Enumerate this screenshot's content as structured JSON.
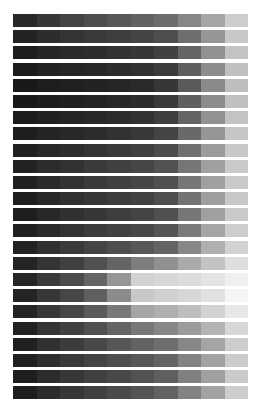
{
  "chart_data": {
    "type": "heatmap",
    "title": "",
    "xlabel": "",
    "ylabel": "",
    "rows": 24,
    "columns": 10,
    "value_scale": "grayscale 0-255 (0=black, 255=white)",
    "values": [
      [
        40,
        55,
        68,
        78,
        88,
        98,
        108,
        135,
        165,
        205
      ],
      [
        35,
        45,
        52,
        58,
        62,
        68,
        78,
        110,
        150,
        200
      ],
      [
        30,
        38,
        42,
        45,
        50,
        55,
        65,
        100,
        145,
        195
      ],
      [
        28,
        35,
        38,
        40,
        45,
        50,
        60,
        95,
        140,
        192
      ],
      [
        25,
        30,
        32,
        35,
        38,
        42,
        55,
        90,
        138,
        190
      ],
      [
        25,
        30,
        33,
        36,
        40,
        45,
        58,
        95,
        140,
        192
      ],
      [
        28,
        33,
        36,
        40,
        44,
        50,
        62,
        100,
        145,
        195
      ],
      [
        30,
        36,
        40,
        44,
        50,
        56,
        68,
        105,
        150,
        198
      ],
      [
        32,
        40,
        45,
        52,
        58,
        64,
        76,
        112,
        155,
        200
      ],
      [
        34,
        44,
        50,
        58,
        64,
        70,
        82,
        118,
        160,
        202
      ],
      [
        32,
        42,
        50,
        58,
        64,
        70,
        80,
        118,
        160,
        202
      ],
      [
        30,
        40,
        48,
        55,
        60,
        66,
        78,
        115,
        158,
        200
      ],
      [
        30,
        40,
        48,
        55,
        62,
        68,
        80,
        118,
        160,
        202
      ],
      [
        32,
        42,
        52,
        60,
        66,
        72,
        85,
        122,
        165,
        205
      ],
      [
        34,
        48,
        58,
        68,
        78,
        88,
        100,
        135,
        175,
        210
      ],
      [
        36,
        52,
        64,
        80,
        100,
        125,
        145,
        170,
        195,
        222
      ],
      [
        38,
        58,
        75,
        100,
        150,
        210,
        215,
        220,
        228,
        240
      ],
      [
        36,
        55,
        70,
        95,
        140,
        200,
        208,
        215,
        225,
        245
      ],
      [
        36,
        55,
        70,
        90,
        120,
        165,
        175,
        190,
        210,
        232
      ],
      [
        34,
        52,
        65,
        80,
        100,
        120,
        135,
        155,
        180,
        215
      ],
      [
        32,
        48,
        60,
        72,
        86,
        98,
        110,
        135,
        165,
        205
      ],
      [
        32,
        46,
        58,
        68,
        78,
        88,
        100,
        130,
        162,
        204
      ],
      [
        30,
        44,
        55,
        64,
        72,
        82,
        95,
        128,
        160,
        202
      ],
      [
        30,
        44,
        55,
        64,
        74,
        84,
        98,
        130,
        162,
        205
      ]
    ]
  }
}
